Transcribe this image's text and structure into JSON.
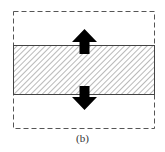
{
  "figure": {
    "caption": "(b)",
    "boundary": {
      "style": "dashed",
      "color": "#555555"
    },
    "band": {
      "style": "hatched",
      "stroke_color": "#444444",
      "hatch_color": "#9a9a9a"
    },
    "arrows": [
      {
        "direction": "up",
        "color": "#000000"
      },
      {
        "direction": "down",
        "color": "#000000"
      }
    ]
  }
}
